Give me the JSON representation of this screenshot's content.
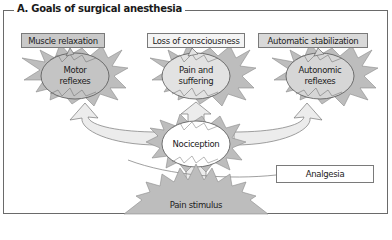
{
  "title": "A. Goals of surgical anesthesia",
  "goals": [
    {
      "label": "Muscle relaxation",
      "target": "Motor reflexes"
    },
    {
      "label": "Loss of consciousness",
      "target": "Pain and suffering"
    },
    {
      "label": "Automatic stabilization",
      "target": "Autonomic reflexes"
    }
  ],
  "center": {
    "nociception": "Nociception",
    "analgesia": "Analgesia",
    "stimulus": "Pain stimulus"
  },
  "ellipse_text": {
    "motor_1": "Motor",
    "motor_2": "reflexes",
    "pain_1": "Pain and",
    "pain_2": "suffering",
    "auto_1": "Autonomic",
    "auto_2": "reflexes"
  },
  "colors": {
    "dark_fill": "#c4c4c4",
    "light_fill": "#ececec",
    "burst_fill": "#bdbdbd",
    "border": "#6a6a6a"
  }
}
